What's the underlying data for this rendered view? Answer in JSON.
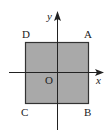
{
  "diagram": {
    "type": "coordinate-plane-square",
    "axes": {
      "x_label": "x",
      "y_label": "y",
      "origin_label": "O"
    },
    "square": {
      "fill": "#a9a9a9",
      "stroke": "#333333",
      "vertices": [
        {
          "label": "A",
          "position": "top-right"
        },
        {
          "label": "B",
          "position": "bottom-right"
        },
        {
          "label": "C",
          "position": "bottom-left"
        },
        {
          "label": "D",
          "position": "top-left"
        }
      ]
    }
  }
}
